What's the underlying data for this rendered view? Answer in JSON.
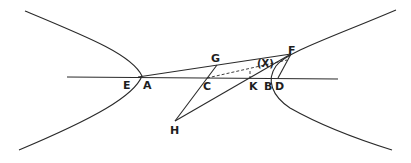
{
  "figure": {
    "type": "hyperbola construction diagram",
    "labels": {
      "E": "E",
      "A": "A",
      "G": "G",
      "C": "C",
      "K": "K",
      "B": "B",
      "D": "D",
      "F": "F",
      "H": "H",
      "X": "(X)"
    },
    "colors": {
      "ink": "#2a2a2a",
      "background": "#ffffff"
    }
  }
}
